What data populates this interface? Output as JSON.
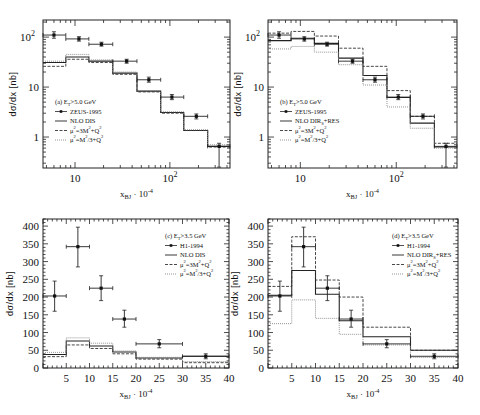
{
  "chart_data": [
    {
      "panel": "a",
      "type": "line",
      "xscale": "log",
      "yscale": "log",
      "xlabel": "x_BJ · 10^-4",
      "ylabel": "dσ/dx [nb]",
      "xlim": [
        4.6,
        430
      ],
      "ylim": [
        0.24,
        220
      ],
      "xticks_major": [
        "10",
        "10^2"
      ],
      "yticks_major": [
        "1",
        "10",
        "10^2"
      ],
      "legend_title": "(a) E_T > 5.0 GeV",
      "legend": [
        "ZEUS-1995",
        "NLO DIS",
        "μ²=3M²+Q²",
        "μ²=M²/3+Q²"
      ],
      "bin_edges": [
        4.6,
        8,
        14,
        25,
        45,
        80,
        140,
        250,
        430
      ],
      "data_points": {
        "name": "ZEUS-1995",
        "x": [
          6,
          11,
          19,
          35,
          60,
          105,
          190,
          330
        ],
        "y": [
          110,
          92,
          72,
          33,
          14,
          6.3,
          2.6,
          0.65
        ],
        "yerr_low": [
          95,
          83,
          66,
          30,
          12.5,
          5.6,
          2.3,
          0.25
        ],
        "yerr_high": [
          128,
          102,
          79,
          36,
          15.8,
          7.1,
          2.9,
          0.75
        ]
      },
      "series": [
        {
          "name": "NLO DIS",
          "style": "solid",
          "values": [
            31,
            40,
            33,
            19,
            8.3,
            3.1,
            1.35,
            0.65
          ]
        },
        {
          "name": "μ²=3M²+Q²",
          "style": "dashed",
          "values": [
            26,
            36,
            31,
            18,
            8,
            3,
            1.35,
            0.63
          ]
        },
        {
          "name": "μ²=M²/3+Q²",
          "style": "dotted",
          "values": [
            33,
            45,
            35,
            20,
            8.5,
            3.2,
            1.4,
            0.7
          ]
        }
      ]
    },
    {
      "panel": "b",
      "type": "line",
      "xscale": "log",
      "yscale": "log",
      "xlabel": "x_BJ · 10^-4",
      "ylabel": "dσ/dx [nb]",
      "xlim": [
        4.6,
        430
      ],
      "ylim": [
        0.24,
        220
      ],
      "xticks_major": [
        "10",
        "10^2"
      ],
      "yticks_major": [
        "1",
        "10",
        "10^2"
      ],
      "legend_title": "(b) E_T > 5.0 GeV",
      "legend": [
        "ZEUS-1995",
        "NLO DIR_S+RES",
        "μ²=3M²+Q²",
        "μ²=M²/3+Q²"
      ],
      "bin_edges": [
        4.6,
        8,
        14,
        25,
        45,
        80,
        140,
        250,
        430
      ],
      "data_points": {
        "name": "ZEUS-1995",
        "x": [
          6,
          11,
          19,
          35,
          60,
          105,
          190,
          330
        ],
        "y": [
          110,
          92,
          72,
          33,
          14,
          6.3,
          2.6,
          0.65
        ],
        "yerr_low": [
          95,
          83,
          66,
          30,
          12.5,
          5.6,
          2.3,
          0.25
        ],
        "yerr_high": [
          128,
          102,
          79,
          36,
          15.8,
          7.1,
          2.9,
          0.75
        ]
      },
      "series": [
        {
          "name": "NLO DIR_S+RES",
          "style": "solid",
          "values": [
            85,
            95,
            75,
            38,
            17,
            6.2,
            1.9,
            0.63
          ]
        },
        {
          "name": "μ²=3M²+Q²",
          "style": "dashed",
          "values": [
            120,
            130,
            105,
            60,
            26,
            8.5,
            2.6,
            0.75
          ]
        },
        {
          "name": "μ²=M²/3+Q²",
          "style": "dotted",
          "values": [
            58,
            65,
            50,
            28,
            11,
            4,
            1.5,
            0.6
          ]
        }
      ]
    },
    {
      "panel": "c",
      "type": "line",
      "xscale": "linear",
      "yscale": "linear",
      "xlabel": "x_BJ · 10^-4",
      "ylabel": "dσ/dx [nb]",
      "xlim": [
        0,
        40
      ],
      "ylim": [
        0,
        420
      ],
      "xticks": [
        5,
        10,
        15,
        20,
        25,
        30,
        35,
        40
      ],
      "yticks": [
        0,
        50,
        100,
        150,
        200,
        250,
        300,
        350,
        400
      ],
      "legend_title": "(c) E_T > 3.5 GeV",
      "legend": [
        "H1-1994",
        "NLO DIS",
        "μ²=3M²+Q²",
        "μ²=M²/3+Q²"
      ],
      "bin_edges": [
        0,
        5,
        10,
        15,
        20,
        30,
        40
      ],
      "data_points": {
        "name": "H1-1994",
        "x": [
          2.5,
          7.5,
          12.5,
          17.5,
          25,
          35
        ],
        "xerr": [
          2.5,
          2.5,
          2.5,
          2.5,
          5,
          5
        ],
        "y": [
          203,
          342,
          225,
          138,
          68,
          33
        ],
        "yerr_low": [
          160,
          285,
          190,
          115,
          57,
          26
        ],
        "yerr_high": [
          245,
          397,
          260,
          163,
          80,
          40
        ]
      },
      "series": [
        {
          "name": "NLO DIS",
          "style": "solid",
          "values": [
            38,
            76,
            62,
            45,
            28,
            33
          ]
        },
        {
          "name": "μ²=3M²+Q²",
          "style": "dashed",
          "values": [
            32,
            65,
            55,
            40,
            25,
            15
          ]
        },
        {
          "name": "μ²=M²/3+Q²",
          "style": "dotted",
          "values": [
            44,
            85,
            70,
            48,
            30,
            18
          ]
        }
      ]
    },
    {
      "panel": "d",
      "type": "line",
      "xscale": "linear",
      "yscale": "linear",
      "xlabel": "x_BJ · 10^-4",
      "ylabel": "dσ/dx [nb]",
      "xlim": [
        0,
        40
      ],
      "ylim": [
        0,
        420
      ],
      "xticks": [
        5,
        10,
        15,
        20,
        25,
        30,
        35,
        40
      ],
      "yticks": [
        0,
        50,
        100,
        150,
        200,
        250,
        300,
        350,
        400
      ],
      "legend_title": "(d) E_T > 3.5 GeV",
      "legend": [
        "H1-1994",
        "NLO DIR_S+RES",
        "μ²=3M²+Q²",
        "μ²=M²/3+Q²"
      ],
      "bin_edges": [
        0,
        5,
        10,
        15,
        20,
        30,
        40
      ],
      "data_points": {
        "name": "H1-1994",
        "x": [
          2.5,
          7.5,
          12.5,
          17.5,
          25,
          35
        ],
        "xerr": [
          2.5,
          2.5,
          2.5,
          2.5,
          5,
          5
        ],
        "y": [
          203,
          342,
          225,
          138,
          68,
          33
        ],
        "yerr_low": [
          160,
          285,
          190,
          115,
          57,
          26
        ],
        "yerr_high": [
          245,
          397,
          260,
          163,
          80,
          40
        ]
      },
      "series": [
        {
          "name": "NLO DIR_S+RES",
          "style": "solid",
          "values": [
            205,
            275,
            208,
            133,
            88,
            50
          ]
        },
        {
          "name": "μ²=3M²+Q²",
          "style": "dashed",
          "values": [
            230,
            370,
            248,
            200,
            115,
            50
          ]
        },
        {
          "name": "μ²=M²/3+Q²",
          "style": "dotted",
          "values": [
            125,
            192,
            140,
            95,
            65,
            30
          ]
        }
      ]
    }
  ],
  "layout": {
    "panels": [
      {
        "left": 43,
        "right": 230,
        "top": 20,
        "bottom": 168
      },
      {
        "left": 268,
        "right": 457,
        "top": 20,
        "bottom": 168
      },
      {
        "left": 43,
        "right": 229,
        "top": 219,
        "bottom": 368
      },
      {
        "left": 268,
        "right": 458,
        "top": 219,
        "bottom": 368
      }
    ]
  }
}
